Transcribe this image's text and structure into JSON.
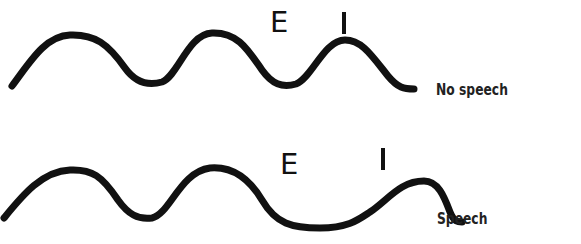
{
  "diagram": {
    "waves": [
      {
        "id": "no-speech",
        "label": "No speech",
        "markers": {
          "E": "E",
          "I": "I"
        }
      },
      {
        "id": "speech",
        "label": "Speech",
        "markers": {
          "E": "E",
          "I": "I"
        }
      }
    ],
    "colors": {
      "stroke": "#111111",
      "background": "#ffffff"
    }
  }
}
